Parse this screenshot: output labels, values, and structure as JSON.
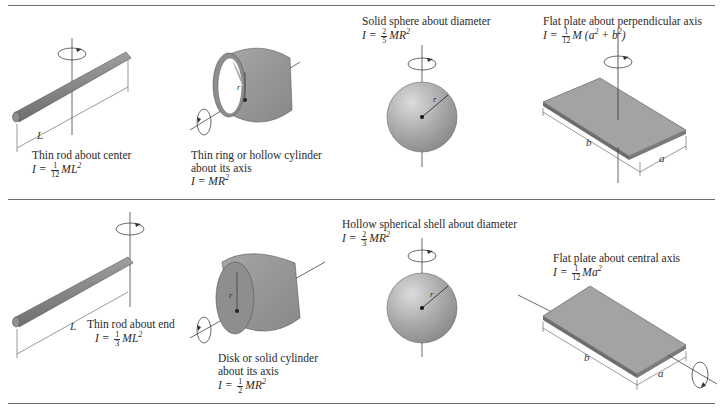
{
  "figure": {
    "rows": [
      {
        "cells": [
          {
            "id": "thin-rod-center",
            "caption": "Thin rod about center",
            "formula_prefix": "I =",
            "frac_num": "1",
            "frac_den": "12",
            "formula_body": "ML",
            "formula_exp": "2",
            "dimension_label": "L"
          },
          {
            "id": "thin-ring",
            "caption_line1": "Thin ring or hollow cylinder",
            "caption_line2": "about its axis",
            "formula_prefix": "I =",
            "formula_body": "MR",
            "formula_exp": "2",
            "radius_label": "r"
          },
          {
            "id": "solid-sphere",
            "caption": "Solid sphere about diameter",
            "formula_prefix": "I =",
            "frac_num": "2",
            "frac_den": "5",
            "formula_body": "MR",
            "formula_exp": "2",
            "radius_label": "r"
          },
          {
            "id": "flat-plate-perpendicular",
            "caption": "Flat plate about perpendicular axis",
            "formula_prefix": "I =",
            "frac_num": "1",
            "frac_den": "12",
            "formula_body": "M (a",
            "formula_exp": "2",
            "formula_mid": " + b",
            "formula_exp2": "2",
            "formula_end": ")",
            "dimension_a": "a",
            "dimension_b": "b"
          }
        ]
      },
      {
        "cells": [
          {
            "id": "thin-rod-end",
            "caption": "Thin rod about end",
            "formula_prefix": "I =",
            "frac_num": "1",
            "frac_den": "3",
            "formula_body": "ML",
            "formula_exp": "2",
            "dimension_label": "L"
          },
          {
            "id": "solid-cylinder",
            "caption_line1": "Disk or solid cylinder",
            "caption_line2": "about its axis",
            "formula_prefix": "I =",
            "frac_num": "1",
            "frac_den": "2",
            "formula_body": "MR",
            "formula_exp": "2",
            "radius_label": "r"
          },
          {
            "id": "hollow-sphere",
            "caption": "Hollow spherical shell about diameter",
            "formula_prefix": "I =",
            "frac_num": "2",
            "frac_den": "3",
            "formula_body": "MR",
            "formula_exp": "2",
            "radius_label": "r"
          },
          {
            "id": "flat-plate-central",
            "caption": "Flat plate about central axis",
            "formula_prefix": "I =",
            "frac_num": "1",
            "frac_den": "12",
            "formula_body": "Ma",
            "formula_exp": "2",
            "dimension_a": "a",
            "dimension_b": "b"
          }
        ]
      }
    ],
    "colors": {
      "object_fill": "#9a9a9a",
      "object_dark": "#6f6f6f",
      "line": "#333333",
      "rule": "#6e6e6e"
    }
  }
}
